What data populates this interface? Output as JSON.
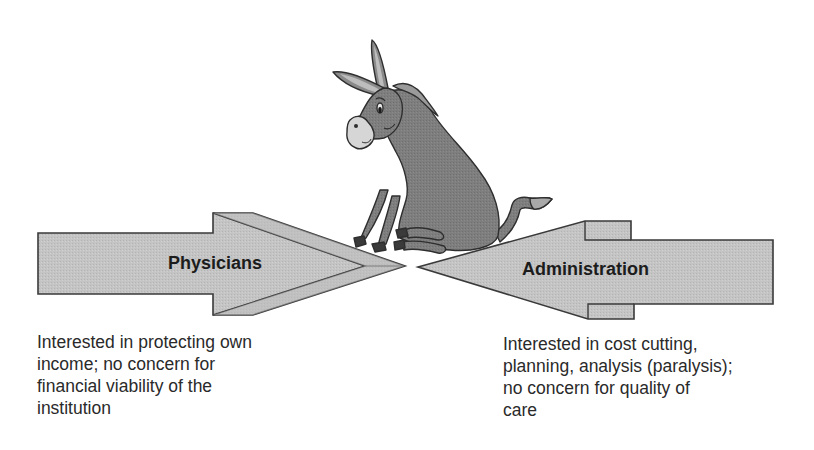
{
  "diagram": {
    "type": "opposing-arrows-illustration",
    "colors": {
      "arrow_fill": "#c4c4c4",
      "arrow_shade": "#b6b6b6",
      "outline": "#3a3a3a",
      "donkey_body": "#7e7e7e",
      "donkey_light": "#cfcfcf",
      "text": "#2a2a2a"
    },
    "left_arrow": {
      "label": "Physicians",
      "direction": "right",
      "caption_lines": [
        "Interested in protecting own",
        "income; no concern for",
        "financial viability of the",
        "institution"
      ]
    },
    "right_arrow": {
      "label": "Administration",
      "direction": "left",
      "caption_lines": [
        "Interested in cost cutting,",
        "planning, analysis (paralysis);",
        "no concern for quality of",
        "care"
      ]
    },
    "center_figure": {
      "icon": "donkey-icon",
      "description": "Cartoon donkey sitting between the two arrow tips"
    }
  }
}
